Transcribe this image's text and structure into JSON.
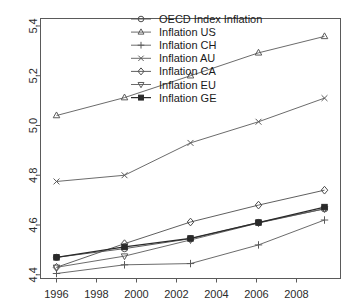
{
  "chart_data": {
    "type": "line",
    "title": "",
    "xlabel": "",
    "ylabel": "",
    "xlim": [
      1995.2,
      2010.2
    ],
    "ylim": [
      4.385,
      5.43
    ],
    "grid": false,
    "legend_position": "top-center",
    "x": [
      1996,
      1999.4,
      2002.7,
      2006.1,
      2009.4
    ],
    "xticks": [
      1996,
      1998,
      2000,
      2002,
      2004,
      2006,
      2008
    ],
    "xticklabels": [
      "1996",
      "1998",
      "2000",
      "2002",
      "2004",
      "2006",
      "2008"
    ],
    "yticks": [
      4.4,
      4.6,
      4.8,
      5.0,
      5.2,
      5.4
    ],
    "yticklabels": [
      "4.4",
      "4.6",
      "4.8",
      "5.0",
      "5.2",
      "5.4"
    ],
    "series": [
      {
        "name": "OECD Index Inflation",
        "marker": "circle",
        "color": "#4d4d4d",
        "values": [
          4.47,
          4.505,
          4.545,
          4.61,
          4.665
        ]
      },
      {
        "name": "Inflation US",
        "marker": "triangle-up",
        "color": "#5a5a5a",
        "values": [
          5.04,
          5.112,
          5.2,
          5.292,
          5.358
        ]
      },
      {
        "name": "Inflation CH",
        "marker": "plus",
        "color": "#5a5a5a",
        "values": [
          4.405,
          4.44,
          4.445,
          4.52,
          4.62
        ]
      },
      {
        "name": "Inflation AU",
        "marker": "x",
        "color": "#5a5a5a",
        "values": [
          4.775,
          4.8,
          4.93,
          5.015,
          5.11
        ]
      },
      {
        "name": "Inflation CA",
        "marker": "diamond",
        "color": "#4d4d4d",
        "values": [
          4.43,
          4.525,
          4.612,
          4.68,
          4.74
        ]
      },
      {
        "name": "Inflation EU",
        "marker": "triangle-down",
        "color": "#5a5a5a",
        "values": [
          4.43,
          4.475,
          4.54,
          4.608,
          4.665
        ]
      },
      {
        "name": "Inflation GE",
        "marker": "square-filled",
        "color": "#2a2a2a",
        "values": [
          4.47,
          4.512,
          4.546,
          4.61,
          4.672
        ]
      }
    ]
  },
  "legend": {
    "items": [
      {
        "label": "OECD Index Inflation"
      },
      {
        "label": "Inflation US"
      },
      {
        "label": "Inflation CH"
      },
      {
        "label": "Inflation AU"
      },
      {
        "label": "Inflation CA"
      },
      {
        "label": "Inflation EU"
      },
      {
        "label": "Inflation GE"
      }
    ]
  },
  "axes": {
    "frame_color": "#5a5a5a",
    "tick_color": "#5a5a5a",
    "label_color": "#2b2b2b"
  }
}
